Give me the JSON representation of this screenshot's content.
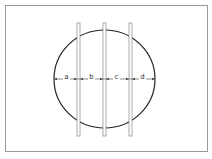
{
  "diagram": {
    "shape": "circle",
    "vertical_bars": 3,
    "segments": [
      {
        "label": "a"
      },
      {
        "label": "b"
      },
      {
        "label": "c"
      },
      {
        "label": "d"
      }
    ],
    "colors": {
      "circle": "#222222",
      "bar": "#888888",
      "frame": "#999999",
      "arrow": "#555555"
    }
  }
}
